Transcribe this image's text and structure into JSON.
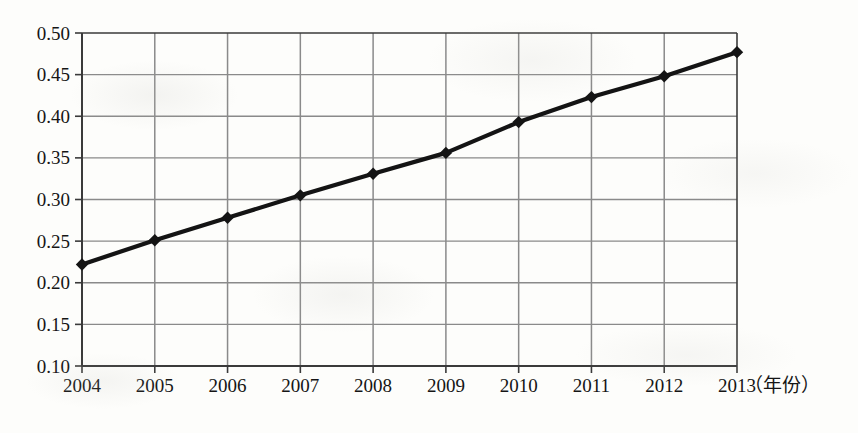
{
  "chart_data": {
    "type": "line",
    "title": "",
    "subtitle": "",
    "xlabel": "（年份）",
    "ylabel": "",
    "categories": [
      "2004",
      "2005",
      "2006",
      "2007",
      "2008",
      "2009",
      "2010",
      "2011",
      "2012",
      "2013"
    ],
    "x": [
      2004,
      2005,
      2006,
      2007,
      2008,
      2009,
      2010,
      2011,
      2012,
      2013
    ],
    "values": [
      0.222,
      0.251,
      0.278,
      0.305,
      0.331,
      0.356,
      0.393,
      0.423,
      0.448,
      0.477
    ],
    "series": [
      {
        "name": "",
        "values": [
          0.222,
          0.251,
          0.278,
          0.305,
          0.331,
          0.356,
          0.393,
          0.423,
          0.448,
          0.477
        ]
      }
    ],
    "ylim": [
      0.1,
      0.5
    ],
    "xlim": [
      2004,
      2013
    ],
    "ytick_labels": [
      "0.50",
      "0.45",
      "0.40",
      "0.35",
      "0.30",
      "0.25",
      "0.20",
      "0.15",
      "0.10"
    ],
    "ytick_values": [
      0.5,
      0.45,
      0.4,
      0.35,
      0.3,
      0.25,
      0.2,
      0.15,
      0.1
    ],
    "xtick_labels": [
      "2004",
      "2005",
      "2006",
      "2007",
      "2008",
      "2009",
      "2010",
      "2011",
      "2012",
      "2013"
    ],
    "grid": true,
    "grid_x": true,
    "grid_y": true,
    "legend": false,
    "legend_position": "none",
    "marker": "diamond",
    "line_color": "#141414",
    "marker_color": "#141414",
    "grid_color": "#8a8a8a",
    "axis_color": "#3a3a3a",
    "background_color": "#fdfdfb",
    "annotations": []
  },
  "axis_unit_label": "（年份）"
}
